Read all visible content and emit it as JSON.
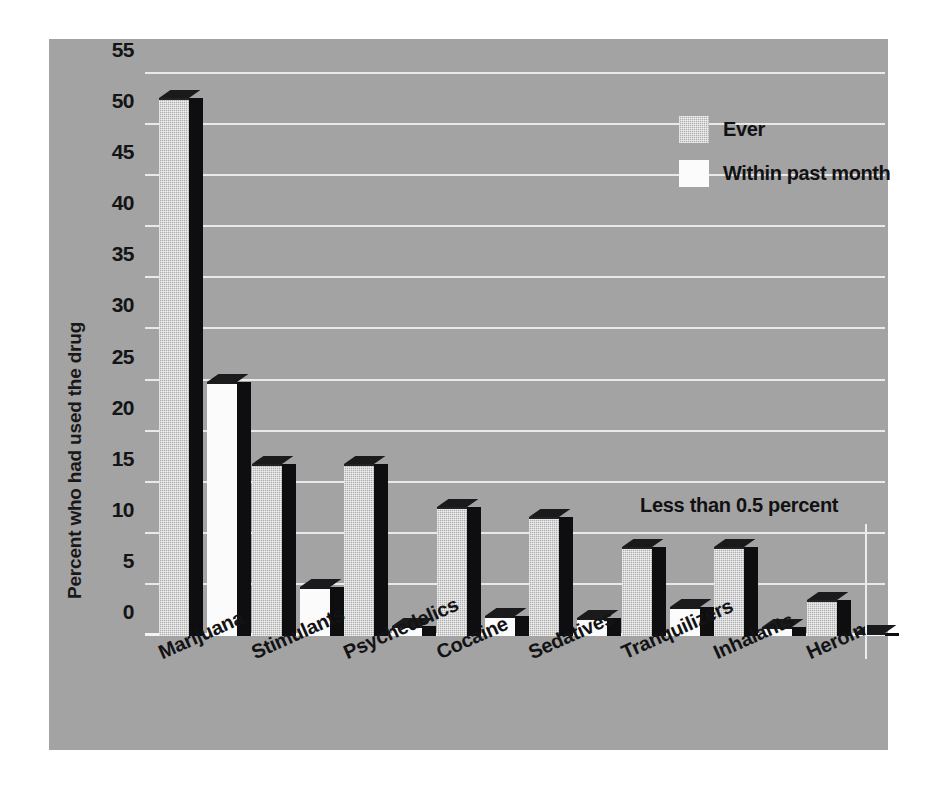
{
  "chart_data": {
    "type": "bar",
    "title": "",
    "xlabel": "",
    "ylabel": "Percent who had used the drug",
    "ylim": [
      0,
      55
    ],
    "yticks": [
      0,
      5,
      10,
      15,
      20,
      25,
      30,
      35,
      40,
      45,
      50,
      55
    ],
    "grid": true,
    "legend_position": "top-right",
    "categories": [
      "Marijuana",
      "Stimulants",
      "Psychedelics",
      "Cocaine",
      "Sedatives",
      "Tranquilizers",
      "Inhalants",
      "Heroin"
    ],
    "series": [
      {
        "name": "Ever",
        "values": [
          52.7,
          16.8,
          16.8,
          12.6,
          11.6,
          8.7,
          8.7,
          3.5
        ],
        "color": "#aeaeae"
      },
      {
        "name": "Within past month",
        "values": [
          24.9,
          4.8,
          1.0,
          2.0,
          1.8,
          2.8,
          0.9,
          0.3
        ],
        "color": "#fbfbfb"
      }
    ],
    "annotations": [
      {
        "text": "Less than 0.5 percent",
        "points_to": "Heroin / Within past month"
      }
    ],
    "background_color": "#a3a3a3",
    "gridline_color": "#e9e9e9"
  },
  "legend": {
    "items": [
      {
        "label": "Ever"
      },
      {
        "label": "Within past month"
      }
    ]
  },
  "axis": {
    "y_title": "Percent who had used the drug"
  },
  "annotation": {
    "text": "Less than 0.5 percent"
  }
}
